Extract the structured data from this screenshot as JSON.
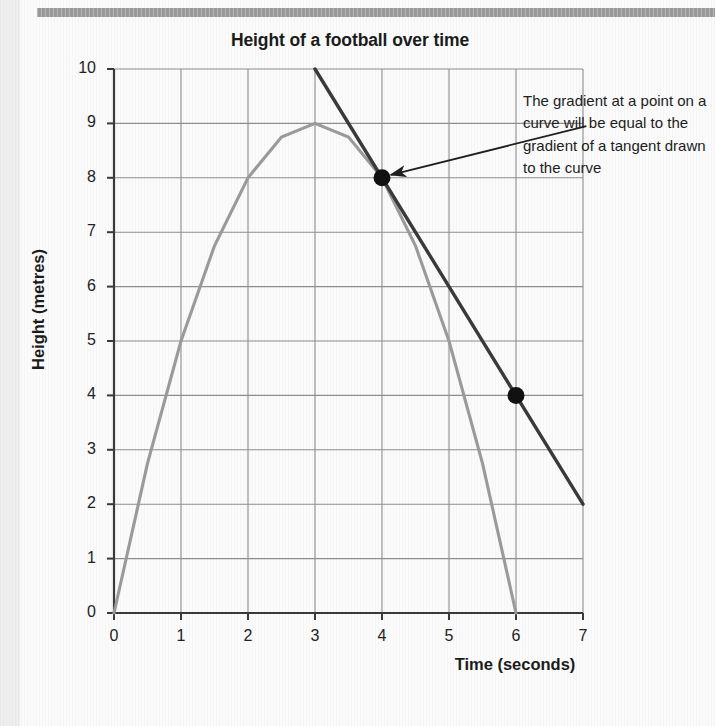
{
  "page": {
    "background_color": "#fbfbfb",
    "margin_strip_color": "#efefef",
    "top_rule_color": "#9a9a9a"
  },
  "chart_data": {
    "type": "line",
    "title": "Height of a football over time",
    "xlabel": "Time (seconds)",
    "ylabel": "Height (metres)",
    "xlim": [
      0,
      7
    ],
    "ylim": [
      0,
      10
    ],
    "xticks": [
      "0",
      "1",
      "2",
      "3",
      "4",
      "5",
      "6",
      "7"
    ],
    "yticks": [
      "0",
      "1",
      "2",
      "3",
      "4",
      "5",
      "6",
      "7",
      "8",
      "9",
      "10"
    ],
    "grid": true,
    "legend": "none",
    "series": [
      {
        "name": "Height of football (curve)",
        "kind": "curve",
        "color": "#9b9b9b",
        "equation": "h = t(6 - t)",
        "x": [
          0,
          0.5,
          1,
          1.5,
          2,
          2.5,
          3,
          3.5,
          4,
          4.5,
          5,
          5.5,
          6
        ],
        "values": [
          0,
          2.75,
          5,
          6.75,
          8,
          8.75,
          9,
          8.75,
          8,
          6.75,
          5,
          2.75,
          0
        ]
      },
      {
        "name": "Tangent at t = 4",
        "kind": "line",
        "color": "#3a3a3a",
        "gradient": -2,
        "x": [
          3,
          7
        ],
        "values": [
          10,
          2
        ]
      }
    ],
    "markers": [
      {
        "name": "tangent-point",
        "x": 4,
        "y": 8,
        "color": "#111111"
      },
      {
        "name": "tangent-second-point",
        "x": 6,
        "y": 4,
        "color": "#111111"
      }
    ],
    "annotations": [
      {
        "name": "gradient-note",
        "text": "The gradient at a point on a curve will be equal to the gradient of a tangent drawn to the curve",
        "arrow_from": {
          "x": 7.05,
          "y": 8.95
        },
        "arrow_to": {
          "x": 4,
          "y": 8
        }
      }
    ]
  }
}
